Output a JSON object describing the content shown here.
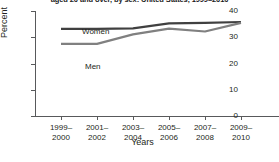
{
  "chart_data": {
    "type": "line",
    "title": "aged 20 and over, by sex: United States, 1999–2010",
    "subtitle": "",
    "xlabel": "Years",
    "ylabel": "Percent",
    "categories": [
      "1999–2000",
      "2001–2002",
      "2003–2004",
      "2005–2006",
      "2007–2008",
      "2009–2010"
    ],
    "category_lines": [
      [
        "1999–",
        "2000"
      ],
      [
        "2001–",
        "2002"
      ],
      [
        "2003–",
        "2004"
      ],
      [
        "2005–",
        "2006"
      ],
      [
        "2007–",
        "2008"
      ],
      [
        "2009–",
        "2010"
      ]
    ],
    "series": [
      {
        "name": "Women",
        "color": "#404040",
        "values": [
          33.2,
          33.2,
          33.4,
          35.3,
          35.5,
          35.8
        ]
      },
      {
        "name": "Men",
        "color": "#808080",
        "values": [
          27.5,
          27.5,
          31.1,
          33.3,
          32.2,
          35.5
        ]
      }
    ],
    "ylim": [
      0,
      40
    ],
    "yticks": [
      0,
      10,
      20,
      30,
      40
    ],
    "ytick_labels": [
      "0",
      "10",
      "20",
      "30",
      "40"
    ],
    "grid": false,
    "legend_position": "inline-labels"
  },
  "axis_colors": {
    "axis": "#58595b",
    "text": "#231f20",
    "background": "#ffffff"
  }
}
